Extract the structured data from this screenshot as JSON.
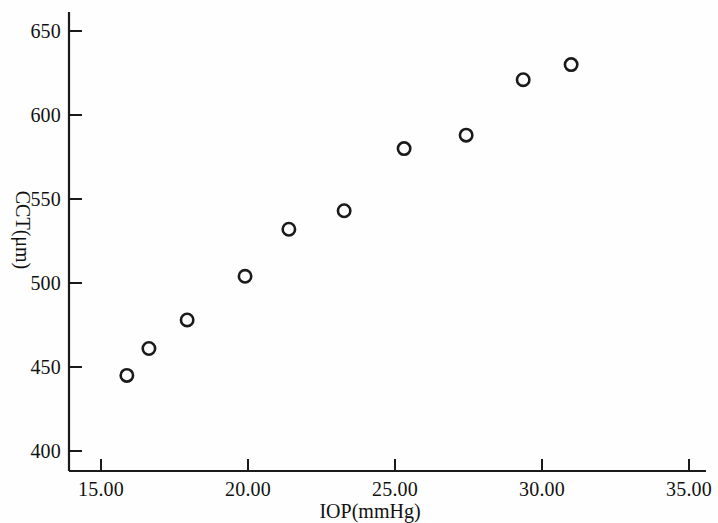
{
  "chart_data": {
    "type": "scatter",
    "title": "",
    "xlabel": "IOP(mmHg)",
    "ylabel": "CCT(μm)",
    "xlim": [
      13.6,
      35.8
    ],
    "ylim": [
      390,
      662
    ],
    "xticks": [
      15.0,
      20.0,
      25.0,
      30.0,
      35.0
    ],
    "xtick_labels": [
      "15.00",
      "20.00",
      "25.00",
      "30.00",
      "35.00"
    ],
    "yticks": [
      400,
      450,
      500,
      550,
      600,
      650
    ],
    "ytick_labels": [
      "400",
      "450",
      "500",
      "550",
      "600",
      "650"
    ],
    "grid": false,
    "legend": null,
    "marker": "open-circle",
    "marker_color": "#1a1a1a",
    "marker_face": "none",
    "points": [
      {
        "x": 15.88,
        "y": 445
      },
      {
        "x": 16.63,
        "y": 461
      },
      {
        "x": 17.93,
        "y": 478
      },
      {
        "x": 19.9,
        "y": 504
      },
      {
        "x": 21.39,
        "y": 532
      },
      {
        "x": 23.27,
        "y": 543
      },
      {
        "x": 25.31,
        "y": 580
      },
      {
        "x": 27.42,
        "y": 588
      },
      {
        "x": 29.36,
        "y": 621
      },
      {
        "x": 30.99,
        "y": 630
      }
    ],
    "series": [
      {
        "name": "CCT vs IOP",
        "x": [
          15.88,
          16.63,
          17.93,
          19.9,
          21.39,
          23.27,
          25.31,
          27.42,
          29.36,
          30.99
        ],
        "values": [
          445,
          461,
          478,
          504,
          532,
          543,
          580,
          588,
          621,
          630
        ]
      }
    ]
  },
  "axes": {
    "x_axis_label": "IOP(mmHg)",
    "y_axis_label": "CCT(μm)"
  },
  "colors": {
    "background": "#fefefe",
    "axis": "#1a1a1a",
    "marker": "#1a1a1a",
    "text": "#111111"
  }
}
